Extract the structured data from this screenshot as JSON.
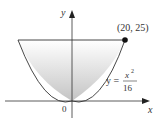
{
  "diagram": {
    "axes": {
      "x_label": "x",
      "y_label": "y",
      "origin_label": "0"
    },
    "curve": {
      "equation_lhs": "y =",
      "numerator": "x",
      "exponent": "2",
      "denominator": "16"
    },
    "point": {
      "label": "(20, 25)"
    },
    "colors": {
      "fill_top": "#ffffff",
      "fill_bottom": "#bfbfbf",
      "line": "#444444"
    }
  }
}
